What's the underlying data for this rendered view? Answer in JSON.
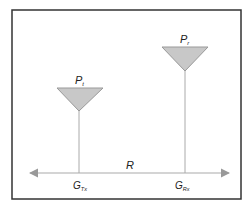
{
  "diagram": {
    "transmitter": {
      "power_label": "P",
      "power_sub": "t",
      "gain_label": "G",
      "gain_sub": "Tx"
    },
    "receiver": {
      "power_label": "P",
      "power_sub": "r",
      "gain_label": "G",
      "gain_sub": "Rx"
    },
    "distance_label": "R",
    "colors": {
      "antenna_fill": "#c8c8c8",
      "antenna_stroke": "#999999",
      "line": "#aaaaaa",
      "border": "#333333"
    }
  }
}
